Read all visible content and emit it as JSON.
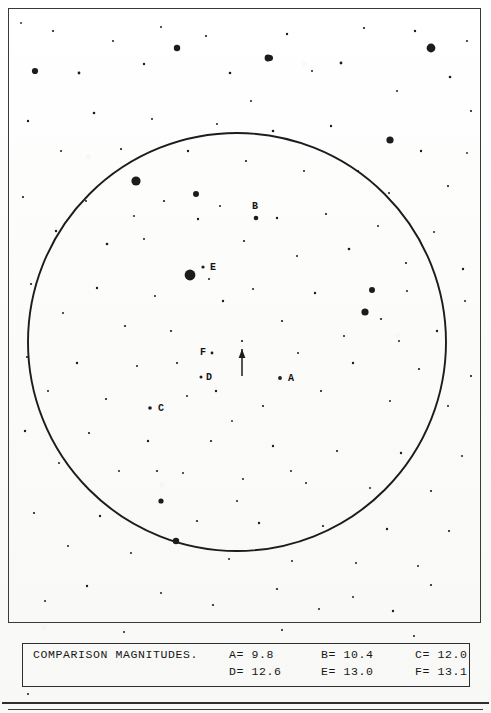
{
  "chart": {
    "type": "star-finder-chart",
    "frame": {
      "x": 8,
      "y": 8,
      "width": 473,
      "height": 615
    },
    "field_circle": {
      "cx": 236,
      "cy": 341,
      "r": 209,
      "stroke": "#1c1c1c",
      "stroke_width": 1.9
    },
    "target_marker": {
      "name": "variable-star-arrow",
      "tip_x": 241,
      "tip_y": 348,
      "tail_y": 375,
      "target_star": {
        "x": 241,
        "y": 340,
        "r": 1.1
      }
    },
    "labels": [
      {
        "id": "A",
        "text": "A",
        "x": 287,
        "y": 373,
        "star_x": 279,
        "star_y": 377,
        "star_r": 1.9
      },
      {
        "id": "B",
        "text": "B",
        "x": 251,
        "y": 201,
        "star_x": 255,
        "star_y": 217,
        "star_r": 2.3
      },
      {
        "id": "C",
        "text": "C",
        "x": 157,
        "y": 403,
        "star_x": 149,
        "star_y": 407,
        "star_r": 1.8
      },
      {
        "id": "D",
        "text": "D",
        "x": 205,
        "y": 372,
        "star_x": 200,
        "star_y": 376,
        "star_r": 1.5
      },
      {
        "id": "E",
        "text": "E",
        "x": 209,
        "y": 262,
        "star_x": 202,
        "star_y": 266,
        "star_r": 1.6
      },
      {
        "id": "F",
        "text": "F",
        "x": 199,
        "y": 347,
        "star_x": 211,
        "star_y": 352,
        "star_r": 1.4
      }
    ],
    "bright_stars": [
      {
        "x": 189,
        "y": 274,
        "r": 5.4
      },
      {
        "x": 135,
        "y": 180,
        "r": 4.6
      },
      {
        "x": 430,
        "y": 47,
        "r": 4.4
      },
      {
        "x": 389,
        "y": 139,
        "r": 3.6
      },
      {
        "x": 267,
        "y": 57,
        "r": 3.4
      },
      {
        "x": 176,
        "y": 47,
        "r": 3.2
      },
      {
        "x": 364,
        "y": 311,
        "r": 3.6
      },
      {
        "x": 175,
        "y": 540,
        "r": 3.2
      },
      {
        "x": 269,
        "y": 57,
        "r": 3.0
      },
      {
        "x": 195,
        "y": 193,
        "r": 3.0
      },
      {
        "x": 34,
        "y": 70,
        "r": 3.1
      },
      {
        "x": 371,
        "y": 289,
        "r": 3.0
      },
      {
        "x": 160,
        "y": 500,
        "r": 2.6
      }
    ],
    "field_stars": [
      {
        "x": 20,
        "y": 22,
        "r": 0.9
      },
      {
        "x": 52,
        "y": 30,
        "r": 1.1
      },
      {
        "x": 78,
        "y": 72,
        "r": 1.4
      },
      {
        "x": 112,
        "y": 40,
        "r": 1.0
      },
      {
        "x": 143,
        "y": 63,
        "r": 1.2
      },
      {
        "x": 160,
        "y": 26,
        "r": 1.0
      },
      {
        "x": 205,
        "y": 35,
        "r": 1.1
      },
      {
        "x": 229,
        "y": 72,
        "r": 1.3
      },
      {
        "x": 250,
        "y": 100,
        "r": 1.0
      },
      {
        "x": 286,
        "y": 33,
        "r": 1.2
      },
      {
        "x": 311,
        "y": 70,
        "r": 1.0
      },
      {
        "x": 340,
        "y": 62,
        "r": 1.4
      },
      {
        "x": 363,
        "y": 27,
        "r": 1.1
      },
      {
        "x": 396,
        "y": 90,
        "r": 1.0
      },
      {
        "x": 414,
        "y": 30,
        "r": 1.2
      },
      {
        "x": 449,
        "y": 76,
        "r": 1.3
      },
      {
        "x": 466,
        "y": 40,
        "r": 1.0
      },
      {
        "x": 470,
        "y": 110,
        "r": 1.1
      },
      {
        "x": 27,
        "y": 120,
        "r": 1.2
      },
      {
        "x": 60,
        "y": 150,
        "r": 1.0
      },
      {
        "x": 93,
        "y": 112,
        "r": 1.3
      },
      {
        "x": 120,
        "y": 148,
        "r": 1.1
      },
      {
        "x": 151,
        "y": 118,
        "r": 1.0
      },
      {
        "x": 187,
        "y": 150,
        "r": 1.2
      },
      {
        "x": 216,
        "y": 123,
        "r": 1.0
      },
      {
        "x": 245,
        "y": 160,
        "r": 1.1
      },
      {
        "x": 272,
        "y": 130,
        "r": 1.3
      },
      {
        "x": 303,
        "y": 170,
        "r": 1.0
      },
      {
        "x": 330,
        "y": 125,
        "r": 1.2
      },
      {
        "x": 357,
        "y": 170,
        "r": 1.1
      },
      {
        "x": 388,
        "y": 192,
        "r": 1.0
      },
      {
        "x": 420,
        "y": 150,
        "r": 1.2
      },
      {
        "x": 447,
        "y": 185,
        "r": 1.1
      },
      {
        "x": 466,
        "y": 152,
        "r": 0.9
      },
      {
        "x": 22,
        "y": 196,
        "r": 1.1
      },
      {
        "x": 55,
        "y": 230,
        "r": 1.2
      },
      {
        "x": 85,
        "y": 200,
        "r": 1.0
      },
      {
        "x": 106,
        "y": 243,
        "r": 1.3
      },
      {
        "x": 133,
        "y": 215,
        "r": 1.0
      },
      {
        "x": 163,
        "y": 200,
        "r": 1.1
      },
      {
        "x": 197,
        "y": 218,
        "r": 1.2
      },
      {
        "x": 219,
        "y": 205,
        "r": 1.0
      },
      {
        "x": 243,
        "y": 240,
        "r": 1.1
      },
      {
        "x": 276,
        "y": 217,
        "r": 1.2
      },
      {
        "x": 296,
        "y": 255,
        "r": 1.0
      },
      {
        "x": 325,
        "y": 213,
        "r": 1.1
      },
      {
        "x": 348,
        "y": 248,
        "r": 1.3
      },
      {
        "x": 377,
        "y": 225,
        "r": 1.0
      },
      {
        "x": 405,
        "y": 262,
        "r": 1.1
      },
      {
        "x": 433,
        "y": 231,
        "r": 1.0
      },
      {
        "x": 462,
        "y": 268,
        "r": 1.2
      },
      {
        "x": 30,
        "y": 283,
        "r": 1.1
      },
      {
        "x": 62,
        "y": 312,
        "r": 1.0
      },
      {
        "x": 96,
        "y": 287,
        "r": 1.2
      },
      {
        "x": 124,
        "y": 325,
        "r": 1.1
      },
      {
        "x": 154,
        "y": 295,
        "r": 1.0
      },
      {
        "x": 170,
        "y": 330,
        "r": 1.1
      },
      {
        "x": 222,
        "y": 300,
        "r": 1.2
      },
      {
        "x": 252,
        "y": 288,
        "r": 1.0
      },
      {
        "x": 281,
        "y": 320,
        "r": 1.1
      },
      {
        "x": 314,
        "y": 292,
        "r": 1.2
      },
      {
        "x": 343,
        "y": 335,
        "r": 1.0
      },
      {
        "x": 380,
        "y": 318,
        "r": 1.1
      },
      {
        "x": 406,
        "y": 290,
        "r": 1.0
      },
      {
        "x": 436,
        "y": 330,
        "r": 1.2
      },
      {
        "x": 464,
        "y": 300,
        "r": 1.0
      },
      {
        "x": 26,
        "y": 356,
        "r": 1.1
      },
      {
        "x": 47,
        "y": 390,
        "r": 1.0
      },
      {
        "x": 76,
        "y": 362,
        "r": 1.2
      },
      {
        "x": 105,
        "y": 398,
        "r": 1.1
      },
      {
        "x": 136,
        "y": 365,
        "r": 1.0
      },
      {
        "x": 176,
        "y": 362,
        "r": 1.1
      },
      {
        "x": 186,
        "y": 395,
        "r": 1.0
      },
      {
        "x": 215,
        "y": 390,
        "r": 1.2
      },
      {
        "x": 231,
        "y": 420,
        "r": 0.9
      },
      {
        "x": 262,
        "y": 405,
        "r": 1.1
      },
      {
        "x": 297,
        "y": 352,
        "r": 1.0
      },
      {
        "x": 320,
        "y": 390,
        "r": 1.1
      },
      {
        "x": 352,
        "y": 362,
        "r": 1.2
      },
      {
        "x": 389,
        "y": 400,
        "r": 1.0
      },
      {
        "x": 418,
        "y": 368,
        "r": 1.1
      },
      {
        "x": 447,
        "y": 405,
        "r": 1.0
      },
      {
        "x": 470,
        "y": 375,
        "r": 1.1
      },
      {
        "x": 24,
        "y": 430,
        "r": 1.2
      },
      {
        "x": 58,
        "y": 462,
        "r": 1.0
      },
      {
        "x": 88,
        "y": 432,
        "r": 1.1
      },
      {
        "x": 118,
        "y": 470,
        "r": 1.0
      },
      {
        "x": 147,
        "y": 440,
        "r": 1.2
      },
      {
        "x": 182,
        "y": 472,
        "r": 1.0
      },
      {
        "x": 210,
        "y": 440,
        "r": 1.1
      },
      {
        "x": 242,
        "y": 478,
        "r": 1.0
      },
      {
        "x": 272,
        "y": 445,
        "r": 1.2
      },
      {
        "x": 305,
        "y": 482,
        "r": 1.0
      },
      {
        "x": 336,
        "y": 450,
        "r": 1.1
      },
      {
        "x": 369,
        "y": 487,
        "r": 1.0
      },
      {
        "x": 400,
        "y": 452,
        "r": 1.2
      },
      {
        "x": 430,
        "y": 490,
        "r": 1.1
      },
      {
        "x": 461,
        "y": 455,
        "r": 1.0
      },
      {
        "x": 33,
        "y": 512,
        "r": 1.1
      },
      {
        "x": 67,
        "y": 545,
        "r": 1.0
      },
      {
        "x": 99,
        "y": 515,
        "r": 1.2
      },
      {
        "x": 130,
        "y": 552,
        "r": 1.0
      },
      {
        "x": 196,
        "y": 520,
        "r": 1.1
      },
      {
        "x": 228,
        "y": 558,
        "r": 1.0
      },
      {
        "x": 258,
        "y": 522,
        "r": 1.2
      },
      {
        "x": 291,
        "y": 560,
        "r": 1.0
      },
      {
        "x": 322,
        "y": 525,
        "r": 1.1
      },
      {
        "x": 355,
        "y": 562,
        "r": 1.0
      },
      {
        "x": 386,
        "y": 528,
        "r": 1.2
      },
      {
        "x": 417,
        "y": 565,
        "r": 1.0
      },
      {
        "x": 448,
        "y": 530,
        "r": 1.1
      },
      {
        "x": 86,
        "y": 585,
        "r": 1.2
      },
      {
        "x": 160,
        "y": 592,
        "r": 1.0
      },
      {
        "x": 276,
        "y": 588,
        "r": 1.1
      },
      {
        "x": 352,
        "y": 596,
        "r": 1.0
      },
      {
        "x": 430,
        "y": 584,
        "r": 1.1
      },
      {
        "x": 44,
        "y": 600,
        "r": 1.0
      },
      {
        "x": 212,
        "y": 604,
        "r": 1.1
      },
      {
        "x": 318,
        "y": 608,
        "r": 1.0
      },
      {
        "x": 392,
        "y": 610,
        "r": 1.2
      },
      {
        "x": 143,
        "y": 238,
        "r": 1.0
      },
      {
        "x": 208,
        "y": 278,
        "r": 1.0
      },
      {
        "x": 290,
        "y": 470,
        "r": 1.0
      },
      {
        "x": 156,
        "y": 470,
        "r": 1.1
      },
      {
        "x": 236,
        "y": 500,
        "r": 1.0
      },
      {
        "x": 398,
        "y": 340,
        "r": 1.0
      }
    ],
    "outer_specks": [
      {
        "x": 124,
        "y": 632,
        "r": 1.0
      },
      {
        "x": 282,
        "y": 630,
        "r": 0.9
      },
      {
        "x": 414,
        "y": 636,
        "r": 0.9
      },
      {
        "x": 28,
        "y": 694,
        "r": 1.4
      }
    ]
  },
  "legend": {
    "title": "COMPARISON MAGNITUDES.",
    "rows": [
      [
        {
          "key": "A=",
          "value": "9.8"
        },
        {
          "key": "B=",
          "value": "10.4"
        },
        {
          "key": "C=",
          "value": "12.0"
        }
      ],
      [
        {
          "key": "D=",
          "value": "12.6"
        },
        {
          "key": "E=",
          "value": "13.0"
        },
        {
          "key": "F=",
          "value": "13.1"
        }
      ]
    ]
  },
  "colors": {
    "ink": "#1c1c1c",
    "paper": "#fbfbfa",
    "frame": "#3a3a3a"
  }
}
